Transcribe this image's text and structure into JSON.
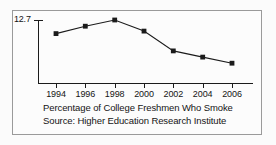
{
  "figure": {
    "caption_title": "Percentage of College Freshmen Who Smoke",
    "caption_source": "Source: Higher Education Research Institute",
    "y_axis_label": "12.7",
    "frame_color": "#9a9a9a",
    "line_color": "#1b1b1b",
    "marker_color": "#1b1b1b",
    "background_color": "#fcfcfc"
  },
  "chart_data": {
    "type": "line",
    "title": "Percentage of College Freshmen Who Smoke",
    "subtitle": "Source: Higher Education Research Institute",
    "xlabel": "",
    "ylabel": "",
    "categories": [
      "1994",
      "1996",
      "1998",
      "2000",
      "2002",
      "2004",
      "2006"
    ],
    "x": [
      1994,
      1996,
      1998,
      2000,
      2002,
      2004,
      2006
    ],
    "values": [
      11.6,
      12.2,
      12.7,
      11.8,
      10.2,
      9.7,
      9.2
    ],
    "y_tick_labels": [
      "12.7"
    ],
    "y_ticks": [
      12.7
    ],
    "ylim": [
      7.6,
      12.7
    ],
    "grid": false,
    "legend": "none",
    "marker": "square",
    "series": [
      {
        "name": "Percentage of College Freshmen Who Smoke",
        "values": [
          11.6,
          12.2,
          12.7,
          11.8,
          10.2,
          9.7,
          9.2
        ]
      }
    ]
  }
}
